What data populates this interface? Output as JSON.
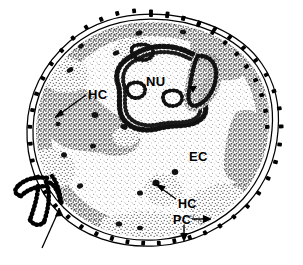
{
  "figure": {
    "background_color": "#ffffff",
    "ink_color": "#000000",
    "width": 303,
    "height": 265
  },
  "labels": {
    "nucleolus": "NU",
    "heterochromatin_upper": "HC",
    "heterochromatin_lower": "HC",
    "euchromatin": "EC",
    "peripheral_chromatin": "PC"
  },
  "structures": {
    "nuclear_envelope": "nuclear-envelope",
    "nuclear_pores": "nuclear-pore-dots",
    "nucleolus_body": "nucleolus",
    "nucleolar_arrowhead": "nucleolus-arrowhead",
    "invagination": "nuclear-envelope-invagination",
    "invagination_arrow": "invagination-arrow",
    "interchromatin_granules": "interchromatin-granule-clusters"
  },
  "leaders": {
    "hc_upper_arrow": "arrow-to-upper-heterochromatin",
    "hc_lower_arrow": "arrow-to-lower-heterochromatin",
    "pc_arrow_right": "arrow-right-to-peripheral-chromatin",
    "pc_arrow_down": "arrow-down-to-peripheral-chromatin"
  },
  "colors": {
    "ink": "#000000",
    "euchromatin_stipple": "#8a8a8a",
    "heterochromatin_dense": "#4a4a4a",
    "paper": "#ffffff"
  }
}
